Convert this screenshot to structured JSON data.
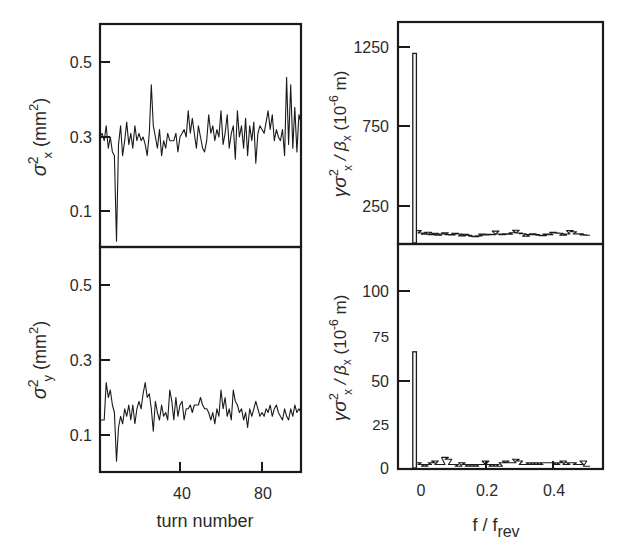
{
  "figure": {
    "panels": {
      "top_left": {
        "ylabel_main": "σ",
        "ylabel_sup": "2",
        "ylabel_sub": "x",
        "ylabel_unit": "(mm",
        "ylabel_unit_sup": "2",
        "ylabel_close": ")",
        "yticks": [
          "0.5",
          "0.3",
          "0.1"
        ]
      },
      "bottom_left": {
        "ylabel_main": "σ",
        "ylabel_sup": "2",
        "ylabel_sub": "y",
        "ylabel_unit": "(mm",
        "ylabel_unit_sup": "2",
        "ylabel_close": ")",
        "yticks": [
          "0.5",
          "0.3",
          "0.1"
        ],
        "xticks": [
          "40",
          "80"
        ],
        "xlabel": "turn number"
      },
      "top_right": {
        "ylabel": "γσ²ₓ / βₓ (10⁻⁶ m)",
        "yticks": [
          "1250",
          "750",
          "250"
        ]
      },
      "bottom_right": {
        "ylabel": "γσ²ₓ / βₓ (10⁻⁶ m)",
        "yticks": [
          "100",
          "75",
          "50",
          "25",
          "0"
        ],
        "xticks": [
          "0",
          "0.2",
          "0.4"
        ],
        "xlabel_main": "f / f",
        "xlabel_sub": "rev"
      }
    },
    "right_ylabel_parts": {
      "gamma": "γσ",
      "sup": "2",
      "sub": "x",
      "slash": " / β",
      "sub2": "x",
      "unit": " (10",
      "unit_sup": "-6",
      "unit_end": " m)"
    }
  },
  "chart_data": [
    {
      "type": "line",
      "panel": "top_left",
      "title": "",
      "xlabel": "turn number",
      "ylabel": "σ²x (mm²)",
      "xlim": [
        1,
        99
      ],
      "ylim": [
        0.0,
        0.6
      ],
      "yticks": [
        0.1,
        0.3,
        0.5
      ],
      "grid": false,
      "series": [
        {
          "name": "horizontal beam size squared",
          "x": [
            1,
            2,
            3,
            4,
            5,
            6,
            7,
            8,
            9,
            10,
            11,
            12,
            13,
            14,
            15,
            16,
            17,
            18,
            19,
            20,
            21,
            22,
            23,
            24,
            25,
            26,
            27,
            28,
            29,
            30,
            31,
            32,
            33,
            34,
            35,
            36,
            37,
            38,
            39,
            40,
            41,
            42,
            43,
            44,
            45,
            46,
            47,
            48,
            49,
            50,
            51,
            52,
            53,
            54,
            55,
            56,
            57,
            58,
            59,
            60,
            61,
            62,
            63,
            64,
            65,
            66,
            67,
            68,
            69,
            70,
            71,
            72,
            73,
            74,
            75,
            76,
            77,
            78,
            79,
            80,
            81,
            82,
            83,
            84,
            85,
            86,
            87,
            88,
            89,
            90,
            91,
            92,
            93,
            94,
            95,
            96,
            97,
            98,
            99
          ],
          "values": [
            0.3,
            0.31,
            0.29,
            0.33,
            0.27,
            0.3,
            0.26,
            0.25,
            0.02,
            0.28,
            0.33,
            0.25,
            0.29,
            0.34,
            0.28,
            0.31,
            0.27,
            0.33,
            0.29,
            0.31,
            0.29,
            0.3,
            0.28,
            0.25,
            0.31,
            0.44,
            0.33,
            0.3,
            0.27,
            0.32,
            0.25,
            0.29,
            0.27,
            0.31,
            0.29,
            0.29,
            0.29,
            0.31,
            0.26,
            0.3,
            0.31,
            0.32,
            0.3,
            0.37,
            0.31,
            0.35,
            0.31,
            0.27,
            0.33,
            0.3,
            0.27,
            0.26,
            0.29,
            0.36,
            0.31,
            0.33,
            0.29,
            0.32,
            0.3,
            0.37,
            0.28,
            0.31,
            0.36,
            0.27,
            0.31,
            0.33,
            0.24,
            0.37,
            0.3,
            0.33,
            0.27,
            0.35,
            0.25,
            0.33,
            0.29,
            0.34,
            0.23,
            0.31,
            0.33,
            0.32,
            0.31,
            0.34,
            0.37,
            0.32,
            0.36,
            0.29,
            0.32,
            0.3,
            0.29,
            0.32,
            0.25,
            0.46,
            0.28,
            0.44,
            0.27,
            0.38,
            0.26,
            0.36,
            0.34
          ]
        }
      ]
    },
    {
      "type": "line",
      "panel": "bottom_left",
      "title": "",
      "xlabel": "turn number",
      "ylabel": "σ²y (mm²)",
      "xlim": [
        1,
        99
      ],
      "ylim": [
        0.0,
        0.6
      ],
      "xticks": [
        40,
        80
      ],
      "yticks": [
        0.1,
        0.3,
        0.5
      ],
      "grid": false,
      "series": [
        {
          "name": "vertical beam size squared",
          "x": [
            1,
            2,
            3,
            4,
            5,
            6,
            7,
            8,
            9,
            10,
            11,
            12,
            13,
            14,
            15,
            16,
            17,
            18,
            19,
            20,
            21,
            22,
            23,
            24,
            25,
            26,
            27,
            28,
            29,
            30,
            31,
            32,
            33,
            34,
            35,
            36,
            37,
            38,
            39,
            40,
            41,
            42,
            43,
            44,
            45,
            46,
            47,
            48,
            49,
            50,
            51,
            52,
            53,
            54,
            55,
            56,
            57,
            58,
            59,
            60,
            61,
            62,
            63,
            64,
            65,
            66,
            67,
            68,
            69,
            70,
            71,
            72,
            73,
            74,
            75,
            76,
            77,
            78,
            79,
            80,
            81,
            82,
            83,
            84,
            85,
            86,
            87,
            88,
            89,
            90,
            91,
            92,
            93,
            94,
            95,
            96,
            97,
            98,
            99
          ],
          "values": [
            0.14,
            0.14,
            0.14,
            0.24,
            0.2,
            0.22,
            0.18,
            0.16,
            0.03,
            0.12,
            0.15,
            0.13,
            0.17,
            0.15,
            0.18,
            0.14,
            0.18,
            0.13,
            0.17,
            0.19,
            0.17,
            0.21,
            0.24,
            0.2,
            0.21,
            0.17,
            0.11,
            0.19,
            0.16,
            0.14,
            0.18,
            0.15,
            0.16,
            0.14,
            0.22,
            0.19,
            0.14,
            0.2,
            0.15,
            0.18,
            0.19,
            0.14,
            0.17,
            0.17,
            0.18,
            0.16,
            0.18,
            0.18,
            0.18,
            0.2,
            0.18,
            0.17,
            0.17,
            0.16,
            0.14,
            0.16,
            0.13,
            0.17,
            0.15,
            0.22,
            0.17,
            0.2,
            0.15,
            0.17,
            0.14,
            0.22,
            0.19,
            0.18,
            0.16,
            0.17,
            0.14,
            0.16,
            0.12,
            0.17,
            0.15,
            0.17,
            0.19,
            0.17,
            0.15,
            0.16,
            0.15,
            0.17,
            0.16,
            0.18,
            0.15,
            0.17,
            0.18,
            0.16,
            0.15,
            0.14,
            0.17,
            0.15,
            0.14,
            0.17,
            0.15,
            0.18,
            0.16,
            0.17,
            0.16
          ]
        }
      ]
    },
    {
      "type": "line",
      "panel": "top_right",
      "title": "",
      "xlabel": "f / f_rev",
      "ylabel": "γσ²x / βx (10⁻⁶ m)",
      "xlim": [
        -0.06,
        0.55
      ],
      "ylim": [
        10,
        1410
      ],
      "yticks": [
        250,
        750,
        1250
      ],
      "grid": false,
      "series": [
        {
          "name": "spectrum (horizontal)",
          "x": [
            -0.01,
            0.0,
            0.01,
            0.02,
            0.03,
            0.04,
            0.05,
            0.06,
            0.07,
            0.08,
            0.09,
            0.1,
            0.11,
            0.12,
            0.13,
            0.14,
            0.15,
            0.16,
            0.17,
            0.18,
            0.19,
            0.2,
            0.21,
            0.22,
            0.23,
            0.24,
            0.25,
            0.26,
            0.27,
            0.28,
            0.29,
            0.3,
            0.31,
            0.32,
            0.33,
            0.34,
            0.35,
            0.36,
            0.37,
            0.38,
            0.39,
            0.4,
            0.41,
            0.42,
            0.43,
            0.44,
            0.45,
            0.46,
            0.47,
            0.48,
            0.49,
            0.5
          ],
          "values": [
            1210,
            95,
            80,
            72,
            85,
            70,
            78,
            66,
            74,
            82,
            70,
            68,
            78,
            74,
            62,
            72,
            66,
            60,
            56,
            62,
            74,
            68,
            72,
            70,
            92,
            74,
            70,
            76,
            72,
            82,
            98,
            80,
            76,
            60,
            70,
            76,
            70,
            66,
            64,
            74,
            70,
            84,
            80,
            78,
            66,
            74,
            96,
            88,
            74,
            76,
            68,
            66
          ]
        }
      ]
    },
    {
      "type": "line",
      "panel": "bottom_right",
      "title": "",
      "xlabel": "f / f_rev",
      "ylabel": "γσ²x / βx (10⁻⁶ m)",
      "xlim": [
        -0.06,
        0.55
      ],
      "ylim": [
        0,
        124
      ],
      "xticks": [
        0,
        0.2,
        0.4
      ],
      "yticks": [
        0,
        25,
        50,
        75,
        100
      ],
      "grid": false,
      "series": [
        {
          "name": "spectrum (horizontal, zoomed)",
          "x": [
            -0.01,
            0.0,
            0.01,
            0.02,
            0.03,
            0.04,
            0.05,
            0.06,
            0.07,
            0.08,
            0.09,
            0.1,
            0.11,
            0.12,
            0.13,
            0.14,
            0.15,
            0.16,
            0.17,
            0.18,
            0.19,
            0.2,
            0.21,
            0.22,
            0.23,
            0.24,
            0.25,
            0.26,
            0.27,
            0.28,
            0.29,
            0.3,
            0.31,
            0.32,
            0.33,
            0.34,
            0.35,
            0.36,
            0.37,
            0.38,
            0.39,
            0.4,
            0.41,
            0.42,
            0.43,
            0.44,
            0.45,
            0.46,
            0.47,
            0.48,
            0.49,
            0.5
          ],
          "values": [
            66,
            3,
            2,
            1,
            2,
            3,
            4,
            2,
            2,
            6,
            5,
            2,
            2,
            1,
            3,
            2,
            1,
            2,
            1,
            2,
            2,
            4,
            2,
            1,
            2,
            1,
            3,
            4,
            3,
            3,
            5,
            4,
            2,
            2,
            3,
            2,
            3,
            2,
            3,
            3,
            3,
            3,
            2,
            3,
            4,
            2,
            3,
            3,
            2,
            2,
            4,
            1
          ]
        }
      ]
    }
  ]
}
